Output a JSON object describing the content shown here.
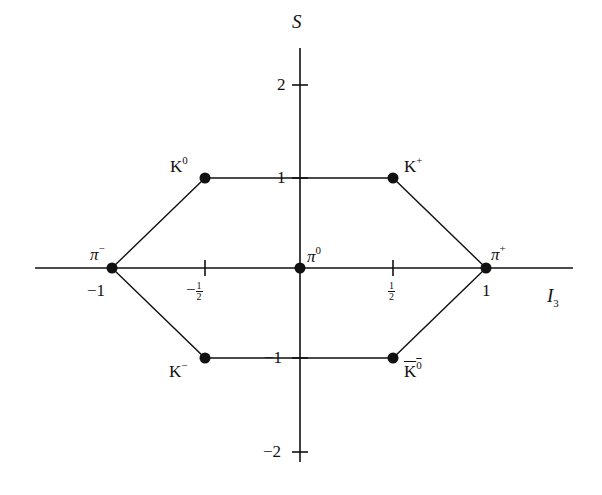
{
  "diagram": {
    "axes": {
      "x": {
        "label": "I",
        "label_sub": "3",
        "ticks": [
          {
            "value": -1,
            "label": "−1"
          },
          {
            "value": -0.5,
            "label_sign": "−",
            "label_num": "1",
            "label_den": "2"
          },
          {
            "value": 0.5,
            "label_num": "1",
            "label_den": "2"
          },
          {
            "value": 1,
            "label": "1"
          }
        ]
      },
      "y": {
        "label": "S",
        "ticks": [
          {
            "value": 2,
            "label": "2"
          },
          {
            "value": 1,
            "label": "1"
          },
          {
            "value": -1,
            "label": "−1"
          },
          {
            "value": -2,
            "label": "−2"
          }
        ]
      }
    },
    "particles": [
      {
        "name": "K",
        "charge": "0",
        "I3": -0.5,
        "S": 1,
        "overline": false
      },
      {
        "name": "K",
        "charge": "+",
        "I3": 0.5,
        "S": 1,
        "overline": false
      },
      {
        "name": "π",
        "charge": "−",
        "I3": -1,
        "S": 0,
        "overline": false
      },
      {
        "name": "π",
        "charge": "0",
        "I3": 0,
        "S": 0,
        "overline": false
      },
      {
        "name": "π",
        "charge": "+",
        "I3": 1,
        "S": 0,
        "overline": false
      },
      {
        "name": "K",
        "charge": "−",
        "I3": -0.5,
        "S": -1,
        "overline": false
      },
      {
        "name": "K",
        "charge": "0",
        "I3": 0.5,
        "S": -1,
        "overline": true
      }
    ],
    "colors": {
      "ink": "#111111",
      "background": "#ffffff"
    }
  }
}
